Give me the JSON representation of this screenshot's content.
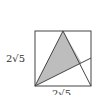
{
  "diagram": {
    "labels": {
      "left_side": "2√5",
      "bottom_side": "2√5"
    },
    "shapes": {
      "square": {
        "x": 35,
        "y": 31,
        "width": 56,
        "height": 55
      },
      "triangle": [
        [
          35,
          86
        ],
        [
          63,
          31
        ],
        [
          91,
          86
        ]
      ],
      "diagonal_line": [
        [
          35,
          86
        ],
        [
          91,
          58
        ]
      ],
      "shaded_region": [
        [
          35,
          86
        ],
        [
          63,
          31
        ],
        [
          81.5,
          62.7
        ]
      ]
    },
    "colors": {
      "stroke": "#444444",
      "fill": "#bdbdbd",
      "background": "#ffffff"
    }
  }
}
